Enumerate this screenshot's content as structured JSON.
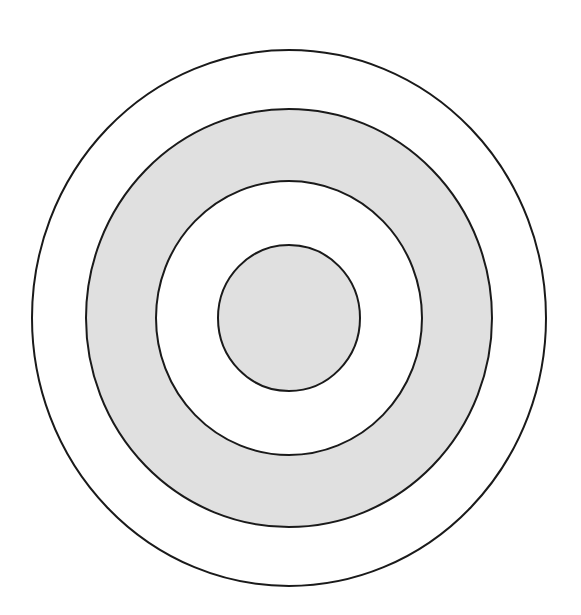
{
  "diagram": {
    "type": "concentric-circles",
    "canvas": {
      "width": 581,
      "height": 615,
      "background": "#ffffff"
    },
    "center": {
      "x": 289,
      "y": 318
    },
    "stroke": {
      "color": "#1a1a1a",
      "width": 2
    },
    "rings": [
      {
        "name": "outer-ring",
        "rx": 257,
        "ry": 268,
        "fill": "#ffffff"
      },
      {
        "name": "second-ring",
        "rx": 203,
        "ry": 209,
        "fill": "#e0e0e0"
      },
      {
        "name": "third-ring",
        "rx": 133,
        "ry": 137,
        "fill": "#ffffff"
      },
      {
        "name": "inner-disc",
        "rx": 71,
        "ry": 73,
        "fill": "#e0e0e0"
      }
    ]
  }
}
